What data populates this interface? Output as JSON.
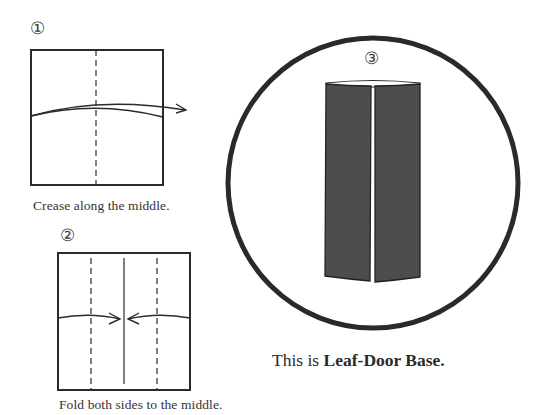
{
  "steps": [
    {
      "number": "①",
      "caption": "Crease along the middle."
    },
    {
      "number": "②",
      "caption": "Fold both sides to the middle."
    },
    {
      "number": "③"
    }
  ],
  "result": {
    "prefix": "This is ",
    "name": "Leaf-Door Base."
  },
  "colors": {
    "line": "#2b2b2b",
    "panel_fill": "#4d4d4d",
    "circle": "#2a2a2a",
    "background": "#ffffff"
  }
}
